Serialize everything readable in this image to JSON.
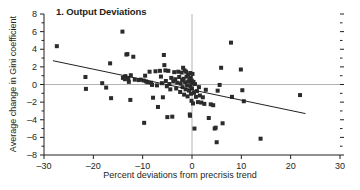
{
  "chart_data": {
    "type": "scatter",
    "title": "1. Output Deviations",
    "xlabel": "Percent deviations from precrisis trend",
    "ylabel": "Average change in Gini coefficient",
    "xlim": [
      -30,
      30
    ],
    "ylim": [
      -8,
      8
    ],
    "xticks": [
      -30,
      -20,
      -10,
      0,
      10,
      20,
      30
    ],
    "xtick_labels": [
      "–30",
      "–20",
      "–10",
      "0",
      "10",
      "20",
      "30"
    ],
    "yticks": [
      -8,
      -6,
      -4,
      -2,
      0,
      2,
      4,
      6,
      8
    ],
    "ytick_labels": [
      "–8",
      "–6",
      "–4",
      "–2",
      "0",
      "2",
      "4",
      "6",
      "8"
    ],
    "yticks_minor": [
      -7,
      -5,
      -3,
      -1,
      1,
      3,
      5,
      7
    ],
    "grid": false,
    "legend": null,
    "zero_line_x": 0,
    "zero_line_y": 0,
    "marker": "square",
    "marker_color": "#2b2b2b",
    "marker_size_px": 4,
    "axis_color": "#231f20",
    "zero_line_color": "#b4b4b4",
    "trendline": {
      "type": "linear",
      "color": "#231f20",
      "x_start": -28.2,
      "y_start": 2.7,
      "x_end": 23.0,
      "y_end": -3.3
    },
    "points": [
      [
        -27.4,
        4.35
      ],
      [
        -21.6,
        0.85
      ],
      [
        -21.5,
        -0.5
      ],
      [
        -18.2,
        0.15
      ],
      [
        -17.4,
        -0.35
      ],
      [
        -16.6,
        2.4
      ],
      [
        -16.4,
        -1.55
      ],
      [
        -14.1,
        6.0
      ],
      [
        -14.0,
        0.75
      ],
      [
        -13.6,
        0.6
      ],
      [
        -13.5,
        0.95
      ],
      [
        -13.3,
        3.4
      ],
      [
        -13.1,
        3.45
      ],
      [
        -12.9,
        0.7
      ],
      [
        -12.8,
        0.3
      ],
      [
        -12.5,
        -1.75
      ],
      [
        -12.4,
        1.05
      ],
      [
        -11.9,
        3.15
      ],
      [
        -11.6,
        0.55
      ],
      [
        -10.8,
        0.5
      ],
      [
        -10.4,
        0.55
      ],
      [
        -9.8,
        0.45
      ],
      [
        -9.7,
        -4.35
      ],
      [
        -9.5,
        1.0
      ],
      [
        -9.3,
        0.35
      ],
      [
        -9.0,
        0.25
      ],
      [
        -8.6,
        1.45
      ],
      [
        -8.3,
        0.2
      ],
      [
        -8.1,
        -0.05
      ],
      [
        -7.9,
        -1.5
      ],
      [
        -7.4,
        1.5
      ],
      [
        -7.1,
        -0.1
      ],
      [
        -6.9,
        -2.55
      ],
      [
        -6.5,
        1.55
      ],
      [
        -6.3,
        0.9
      ],
      [
        -6.1,
        0.15
      ],
      [
        -5.9,
        -1.45
      ],
      [
        -5.7,
        3.35
      ],
      [
        -5.6,
        2.2
      ],
      [
        -5.4,
        1.6
      ],
      [
        -5.3,
        0.4
      ],
      [
        -5.1,
        -0.2
      ],
      [
        -5.0,
        -3.7
      ],
      [
        -4.8,
        1.55
      ],
      [
        -4.6,
        0.05
      ],
      [
        -4.4,
        -0.55
      ],
      [
        -4.2,
        0.75
      ],
      [
        -4.0,
        -3.65
      ],
      [
        -3.8,
        0.35
      ],
      [
        -3.6,
        1.4
      ],
      [
        -3.4,
        0.6
      ],
      [
        -3.2,
        -0.45
      ],
      [
        -3.0,
        0.2
      ],
      [
        -2.8,
        1.45
      ],
      [
        -2.6,
        0.85
      ],
      [
        -2.4,
        -0.85
      ],
      [
        -2.3,
        0.1
      ],
      [
        -2.1,
        1.35
      ],
      [
        -2.0,
        0.5
      ],
      [
        -1.9,
        -0.3
      ],
      [
        -1.8,
        1.9
      ],
      [
        -1.7,
        0.65
      ],
      [
        -1.6,
        -1.15
      ],
      [
        -1.5,
        1.6
      ],
      [
        -1.4,
        0.25
      ],
      [
        -1.3,
        -0.55
      ],
      [
        -1.2,
        1.45
      ],
      [
        -1.1,
        0.9
      ],
      [
        -1.0,
        -0.1
      ],
      [
        -0.9,
        -1.35
      ],
      [
        -0.8,
        1.1
      ],
      [
        -0.7,
        0.35
      ],
      [
        -0.6,
        -0.7
      ],
      [
        -0.5,
        0.6
      ],
      [
        -0.45,
        -3.4
      ],
      [
        -0.4,
        -3.55
      ],
      [
        -0.35,
        1.3
      ],
      [
        -0.3,
        -0.25
      ],
      [
        -0.25,
        0.75
      ],
      [
        -0.2,
        -1.05
      ],
      [
        -0.15,
        0.15
      ],
      [
        -0.1,
        -1.85
      ],
      [
        -0.05,
        0.45
      ],
      [
        0.0,
        -0.45
      ],
      [
        0.1,
        1.2
      ],
      [
        0.2,
        -2.15
      ],
      [
        0.3,
        0.3
      ],
      [
        0.4,
        -0.95
      ],
      [
        0.5,
        -5.0
      ],
      [
        0.6,
        0.05
      ],
      [
        0.8,
        -1.4
      ],
      [
        1.0,
        -0.75
      ],
      [
        1.2,
        -2.0
      ],
      [
        1.4,
        -0.3
      ],
      [
        1.6,
        -1.25
      ],
      [
        1.9,
        -2.05
      ],
      [
        2.2,
        -1.45
      ],
      [
        2.5,
        -2.2
      ],
      [
        2.8,
        -0.6
      ],
      [
        3.4,
        -3.8
      ],
      [
        3.8,
        -2.25
      ],
      [
        4.3,
        -2.35
      ],
      [
        4.6,
        -5.0
      ],
      [
        4.8,
        -4.9
      ],
      [
        5.0,
        -6.55
      ],
      [
        5.2,
        -0.7
      ],
      [
        5.6,
        -0.05
      ],
      [
        5.9,
        1.9
      ],
      [
        6.2,
        -4.4
      ],
      [
        7.9,
        4.75
      ],
      [
        8.1,
        -1.4
      ],
      [
        9.9,
        1.7
      ],
      [
        10.2,
        -0.65
      ],
      [
        10.5,
        -1.9
      ],
      [
        13.9,
        -6.15
      ],
      [
        21.9,
        -1.2
      ]
    ]
  }
}
